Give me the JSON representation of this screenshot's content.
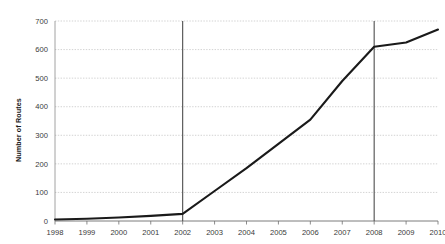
{
  "chart_data": {
    "type": "line",
    "title": "",
    "subtitle": "",
    "xlabel": "",
    "ylabel": "Number of Routes",
    "categories": [
      "1998",
      "1999",
      "2000",
      "2001",
      "2002",
      "2003",
      "2004",
      "2005",
      "2006",
      "2007",
      "2008",
      "2009",
      "2010"
    ],
    "x": [
      1998,
      1999,
      2000,
      2001,
      2002,
      2003,
      2004,
      2005,
      2006,
      2007,
      2008,
      2009,
      2010
    ],
    "values": [
      5,
      8,
      12,
      18,
      25,
      105,
      185,
      270,
      355,
      490,
      610,
      625,
      670
    ],
    "series": [
      {
        "name": "Number of Routes",
        "values": [
          5,
          8,
          12,
          18,
          25,
          105,
          185,
          270,
          355,
          490,
          610,
          625,
          670
        ],
        "color": "#1a1a1a"
      }
    ],
    "ylim": [
      0,
      700
    ],
    "yticks": [
      0,
      100,
      200,
      300,
      400,
      500,
      600,
      700
    ],
    "ytick_labels": [
      "0",
      "100",
      "200",
      "300",
      "400",
      "500",
      "600",
      "700"
    ],
    "xtick_labels": [
      "1998",
      "1999",
      "2000",
      "2001",
      "2002",
      "2003",
      "2004",
      "2005",
      "2006",
      "2007",
      "2008",
      "2009",
      "2010"
    ],
    "grid": "horizontal-dotted",
    "legend": "none",
    "annotations": [
      {
        "type": "vertical-line",
        "x": 2002,
        "label": "2002",
        "color": "#4d4d4d"
      },
      {
        "type": "vertical-line",
        "x": 2008,
        "label": "2008",
        "color": "#4d4d4d"
      }
    ],
    "gridline_color": "#c8c8c8",
    "axis_color": "#6e6e6e",
    "line_color": "#1a1a1a",
    "background_color": "#ffffff"
  }
}
